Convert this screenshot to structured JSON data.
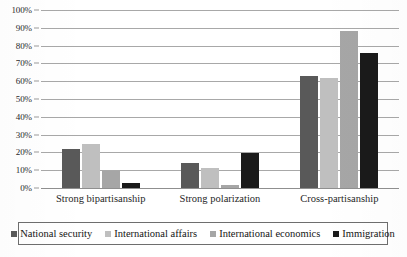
{
  "chart_data": {
    "type": "bar",
    "title": "",
    "xlabel": "",
    "ylabel": "",
    "ylim": [
      0,
      100
    ],
    "ytick_labels": [
      "100%",
      "90%",
      "80%",
      "70%",
      "60%",
      "50%",
      "40%",
      "30%",
      "20%",
      "10%",
      "0%"
    ],
    "ytick_values": [
      100,
      90,
      80,
      70,
      60,
      50,
      40,
      30,
      20,
      10,
      0
    ],
    "grid": "horizontal",
    "legend_position": "bottom",
    "categories": [
      "Strong bipartisanship",
      "Strong polarization",
      "Cross-partisanship"
    ],
    "series": [
      {
        "name": "National security",
        "color": "#595959",
        "values": [
          22,
          14,
          63
        ]
      },
      {
        "name": "International affairs",
        "color": "#bfbfbf",
        "values": [
          25,
          11,
          62
        ]
      },
      {
        "name": "International economics",
        "color": "#a6a6a6",
        "values": [
          9.5,
          1.5,
          88
        ]
      },
      {
        "name": "Immigration",
        "color": "#1a1a1a",
        "values": [
          3,
          19.5,
          76
        ]
      }
    ]
  }
}
